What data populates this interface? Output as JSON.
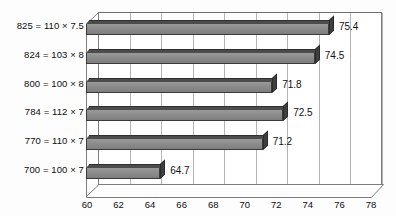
{
  "chart_data": {
    "type": "bar",
    "orientation": "horizontal",
    "title": "",
    "xlabel": "",
    "ylabel": "",
    "categories": [
      "825 = 110 × 7.5",
      "824 = 103 × 8",
      "800 = 100 × 8",
      "784 = 112 × 7",
      "770 = 110 × 7",
      "700 = 100 × 7"
    ],
    "values": [
      75.4,
      74.5,
      71.8,
      72.5,
      71.2,
      64.7
    ],
    "data_labels": [
      "75.4",
      "74.5",
      "71.8",
      "72.5",
      "71.2",
      "64.7"
    ],
    "xlim": [
      60,
      78
    ],
    "xticks": [
      60,
      62,
      64,
      66,
      68,
      70,
      72,
      74,
      76,
      78
    ],
    "xtick_labels": [
      "60",
      "62",
      "64",
      "66",
      "68",
      "70",
      "72",
      "74",
      "76",
      "78"
    ],
    "grid": "vertical",
    "legend": "none",
    "style": "3d-grayscale",
    "colors": {
      "bar_front": "#8c8c8c",
      "bar_top": "#4c4c4c",
      "bar_cap": "#3f3f3f",
      "gridline": "#b4b4b4",
      "axis": "#7d7d7d",
      "text": "#0d0d0d",
      "background": "#ffffff"
    }
  }
}
